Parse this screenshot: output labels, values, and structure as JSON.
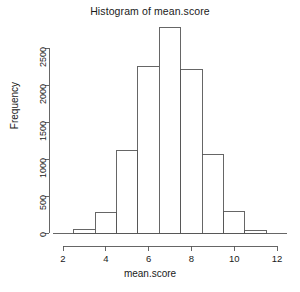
{
  "chart_data": {
    "type": "bar",
    "title": "Histogram of mean.score",
    "xlabel": "mean.score",
    "ylabel": "Frequency",
    "subtitle": "",
    "grid": false,
    "legend": false,
    "legend_position": "none",
    "bin_width": 1,
    "bin_edges": [
      2.5,
      3.5,
      4.5,
      5.5,
      6.5,
      7.5,
      8.5,
      9.5,
      10.5,
      11.5
    ],
    "categories": [
      "2.5-3.5",
      "3.5-4.5",
      "4.5-5.5",
      "5.5-6.5",
      "6.5-7.5",
      "7.5-8.5",
      "8.5-9.5",
      "9.5-10.5",
      "10.5-11.5"
    ],
    "bin_centers": [
      3,
      4,
      5,
      6,
      7,
      8,
      9,
      10,
      11
    ],
    "values": [
      50,
      280,
      1120,
      2250,
      2780,
      2210,
      1060,
      290,
      30
    ],
    "xlim": [
      2,
      12
    ],
    "ylim": [
      0,
      2780
    ],
    "x_ticks": [
      2,
      4,
      6,
      8,
      10,
      12
    ],
    "x_tick_labels": [
      "2",
      "4",
      "6",
      "8",
      "10",
      "12"
    ],
    "y_ticks": [
      0,
      500,
      1000,
      1500,
      2000,
      2500
    ],
    "y_tick_labels": [
      "0",
      "500",
      "1000",
      "1500",
      "2000",
      "2500"
    ],
    "bar_fill": "#ffffff",
    "bar_stroke": "#555555",
    "axis_color": "#555555",
    "text_color": "#1a1a1a",
    "background": "#ffffff"
  }
}
